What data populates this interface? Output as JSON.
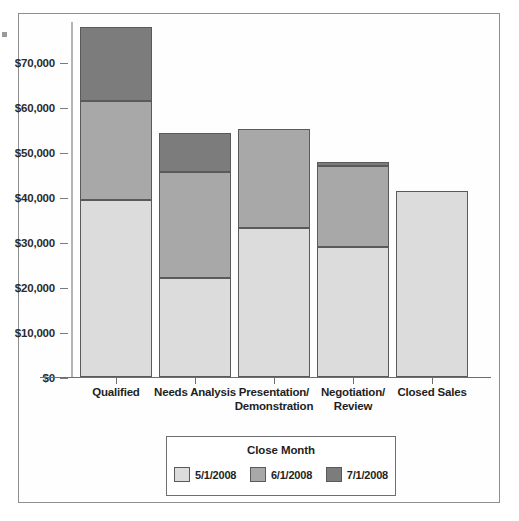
{
  "chart_data": {
    "type": "bar",
    "stacked": true,
    "title": "",
    "subtitle": "",
    "xlabel": "",
    "ylabel": "",
    "categories": [
      "Qualified",
      "Needs Analysis",
      "Presentation/\nDemonstration",
      "Negotiation/\nReview",
      "Closed Sales"
    ],
    "category_labels": [
      {
        "line1": "Qualified",
        "line2": ""
      },
      {
        "line1": "Needs Analysis",
        "line2": ""
      },
      {
        "line1": "Presentation/",
        "line2": "Demonstration"
      },
      {
        "line1": "Negotiation/",
        "line2": "Review"
      },
      {
        "line1": "Closed Sales",
        "line2": ""
      }
    ],
    "series": [
      {
        "name": "5/1/2008",
        "color": "#dcdcdc",
        "values": [
          39500,
          22000,
          33300,
          29000,
          41500
        ]
      },
      {
        "name": "6/1/2008",
        "color": "#a8a8a8",
        "values": [
          22000,
          23800,
          22000,
          18000,
          0
        ]
      },
      {
        "name": "7/1/2008",
        "color": "#7c7c7c",
        "values": [
          16500,
          8500,
          0,
          1000,
          0
        ]
      }
    ],
    "totals": [
      78000,
      54300,
      55300,
      48000,
      41500
    ],
    "ylim": [
      0,
      80000
    ],
    "ytick_values": [
      0,
      10000,
      20000,
      30000,
      40000,
      50000,
      60000,
      70000
    ],
    "ytick_labels": [
      "$0",
      "$10,000",
      "$20,000",
      "$30,000",
      "$40,000",
      "$50,000",
      "$60,000",
      "$70,000"
    ],
    "grid": false,
    "legend_position": "bottom-center"
  },
  "legend": {
    "title": "Close Month",
    "entries": [
      {
        "label": "5/1/2008",
        "color": "#dcdcdc"
      },
      {
        "label": "6/1/2008",
        "color": "#a8a8a8"
      },
      {
        "label": "7/1/2008",
        "color": "#7c7c7c"
      }
    ]
  },
  "colors": {
    "frame_border": "#8e8e90",
    "axis_line": "#6e6e70",
    "value_axis_line": "#b4b4b6",
    "bar_border": "#5a5a5c",
    "text": "#1f1f1f",
    "background": "#ffffff"
  }
}
